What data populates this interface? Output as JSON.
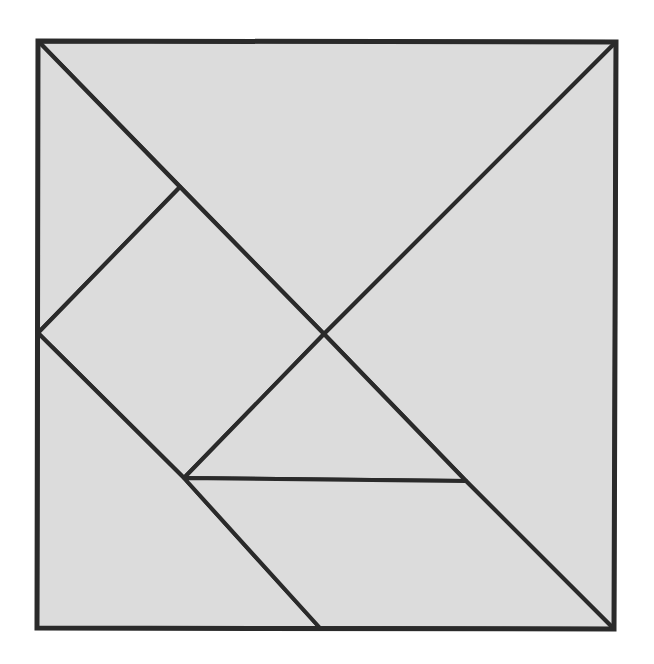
{
  "diagram": {
    "fill_color": "#dcdcdc",
    "stroke_color": "#2a2a2a",
    "pieces": [
      {
        "name": "large-triangle-top",
        "kind": "large triangle"
      },
      {
        "name": "large-triangle-right",
        "kind": "large triangle"
      },
      {
        "name": "small-triangle-top-left",
        "kind": "small triangle"
      },
      {
        "name": "parallelogram-left",
        "kind": "parallelogram"
      },
      {
        "name": "square-center",
        "kind": "square"
      },
      {
        "name": "small-triangle-center",
        "kind": "small triangle"
      },
      {
        "name": "medium-triangle-bottom-left",
        "kind": "medium triangle"
      },
      {
        "name": "bottom-trapezoid",
        "kind": "piece"
      }
    ]
  }
}
